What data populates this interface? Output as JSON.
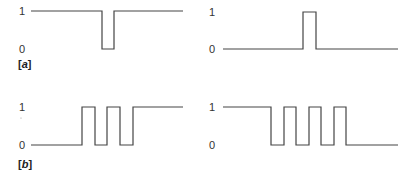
{
  "diagram": {
    "panels": [
      {
        "id": "a-left",
        "y_labels": {
          "high": "1",
          "low": "0"
        },
        "waveform": "high-with-single-low-pulse",
        "points": [
          [
            31,
            11
          ],
          [
            102,
            11
          ],
          [
            102,
            49
          ],
          [
            114,
            49
          ],
          [
            114,
            11
          ],
          [
            183,
            11
          ]
        ]
      },
      {
        "id": "a-right",
        "y_labels": {
          "high": "1",
          "low": "0"
        },
        "waveform": "low-with-single-high-pulse",
        "points": [
          [
            223,
            49
          ],
          [
            303,
            49
          ],
          [
            303,
            12
          ],
          [
            316,
            12
          ],
          [
            316,
            49
          ],
          [
            398,
            49
          ]
        ]
      },
      {
        "id": "b-left",
        "y_labels": {
          "high": "1",
          "low": "0"
        },
        "waveform": "low-then-pulses-then-high",
        "points": [
          [
            31,
            145
          ],
          [
            82,
            145
          ],
          [
            82,
            107
          ],
          [
            95,
            107
          ],
          [
            95,
            145
          ],
          [
            107,
            145
          ],
          [
            107,
            107
          ],
          [
            120,
            107
          ],
          [
            120,
            145
          ],
          [
            133,
            145
          ],
          [
            133,
            107
          ],
          [
            183,
            107
          ]
        ]
      },
      {
        "id": "b-right",
        "y_labels": {
          "high": "1",
          "low": "0"
        },
        "waveform": "high-then-pulses-then-low",
        "points": [
          [
            223,
            107
          ],
          [
            271,
            107
          ],
          [
            271,
            145
          ],
          [
            284,
            145
          ],
          [
            284,
            107
          ],
          [
            296,
            107
          ],
          [
            296,
            145
          ],
          [
            309,
            145
          ],
          [
            309,
            107
          ],
          [
            321,
            107
          ],
          [
            321,
            145
          ],
          [
            334,
            145
          ],
          [
            334,
            107
          ],
          [
            346,
            107
          ],
          [
            346,
            145
          ],
          [
            398,
            145
          ]
        ]
      }
    ],
    "row_tags": {
      "a": {
        "open": "[",
        "letter": "a",
        "close": "]"
      },
      "b": {
        "open": "[",
        "letter": "b",
        "close": "]"
      }
    }
  }
}
